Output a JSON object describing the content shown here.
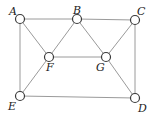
{
  "diagram": {
    "type": "graph",
    "nodes": [
      {
        "id": "A",
        "label": "A",
        "x": 20,
        "y": 19,
        "lx": 9,
        "ly": 15
      },
      {
        "id": "B",
        "label": "B",
        "x": 77,
        "y": 19,
        "lx": 73,
        "ly": 14
      },
      {
        "id": "C",
        "label": "C",
        "x": 135,
        "y": 20,
        "lx": 137,
        "ly": 15
      },
      {
        "id": "F",
        "label": "F",
        "x": 49,
        "y": 57,
        "lx": 46,
        "ly": 71
      },
      {
        "id": "G",
        "label": "G",
        "x": 106,
        "y": 57,
        "lx": 96,
        "ly": 71
      },
      {
        "id": "E",
        "label": "E",
        "x": 20,
        "y": 96,
        "lx": 8,
        "ly": 110
      },
      {
        "id": "D",
        "label": "D",
        "x": 135,
        "y": 98,
        "lx": 138,
        "ly": 112
      }
    ],
    "edges": [
      [
        "A",
        "B"
      ],
      [
        "B",
        "C"
      ],
      [
        "A",
        "E"
      ],
      [
        "A",
        "F"
      ],
      [
        "B",
        "F"
      ],
      [
        "B",
        "G"
      ],
      [
        "C",
        "G"
      ],
      [
        "C",
        "D"
      ],
      [
        "F",
        "G"
      ],
      [
        "F",
        "E"
      ],
      [
        "G",
        "D"
      ],
      [
        "E",
        "D"
      ]
    ]
  }
}
